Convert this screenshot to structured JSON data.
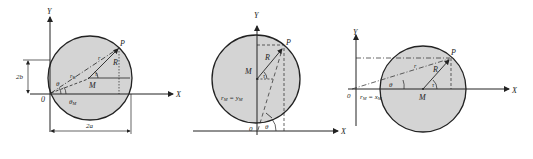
{
  "colors": {
    "disk_fill": "#d4d4d4",
    "stroke": "#222222",
    "background": "#ffffff"
  },
  "diagrams": [
    {
      "id": "general-position",
      "axis_x_label": "X",
      "axis_y_label": "Y",
      "origin_label": "0",
      "center_label": "M",
      "point_label": "P",
      "radius_label": "R",
      "r_label": "r",
      "r_m_label": "r",
      "r_m_sub": "M",
      "theta_label": "θ",
      "theta_m_label": "θ",
      "theta_m_sub": "M",
      "tau_label": "τ",
      "height_label": "2b",
      "width_label": "2a"
    },
    {
      "id": "centered-on-y-axis",
      "axis_x_label": "X",
      "axis_y_label": "Y",
      "origin_label": "0",
      "center_label": "M",
      "point_label": "P",
      "radius_label": "R",
      "tau_label": "τ",
      "theta_label": "θ",
      "equation_lhs": "r",
      "equation_lhs_sub": "M",
      "equation_eq": " = ",
      "equation_rhs": "y",
      "equation_rhs_sub": "M"
    },
    {
      "id": "centered-on-x-axis",
      "axis_x_label": "X",
      "axis_y_label": "Y",
      "origin_label": "0",
      "center_label": "M",
      "point_label": "P",
      "radius_label": "R",
      "r_label": "r",
      "tau_label": "τ",
      "theta_label": "θ",
      "equation_lhs": "r",
      "equation_lhs_sub": "M",
      "equation_eq": " = ",
      "equation_rhs": "x",
      "equation_rhs_sub": "M"
    }
  ]
}
